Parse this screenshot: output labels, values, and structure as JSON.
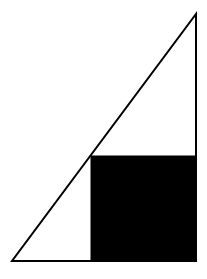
{
  "diagram": {
    "canvas": {
      "width": 207,
      "height": 279,
      "background": "#ffffff"
    },
    "triangle": {
      "vertices": {
        "bottom_left": [
          12,
          261
        ],
        "bottom_right": [
          196,
          261
        ],
        "apex": [
          196,
          14
        ]
      },
      "stroke": "#000000",
      "stroke_width": 2,
      "fill": "none"
    },
    "square": {
      "x": 91,
      "y": 156,
      "size": 105,
      "fill": "#000000",
      "stroke": "#000000"
    }
  }
}
